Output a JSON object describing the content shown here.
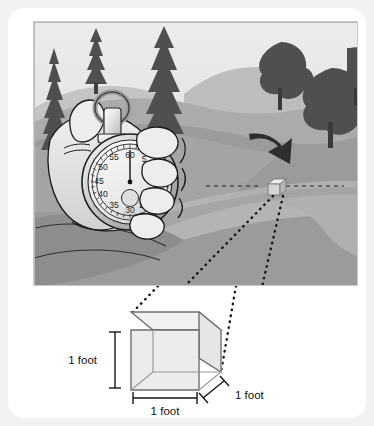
{
  "figure": {
    "type": "illustration",
    "background_color": "#f2f2f2",
    "card_color": "#ffffff"
  },
  "scene": {
    "name": "landscape-photo",
    "sky_color": "#e3e3e3",
    "hill_far_color": "#bdbdbd",
    "hill_mid_color": "#a8a8a8",
    "hill_near_color": "#9a9a9a",
    "field_color": "#8f8f8f",
    "road_color": "#b0b0b0",
    "road_shadow_color": "#9d9d9d",
    "tree_color": "#4f4f4f",
    "trunk_color": "#3f3f3f",
    "arrow_color": "#2b2b2b",
    "conifers": [
      {
        "name": "conifer-left-edge",
        "x": 34,
        "y": 14,
        "w": 20,
        "h": 118
      },
      {
        "name": "conifer-left-inner",
        "x": 82,
        "y": 7,
        "w": 22,
        "h": 56
      },
      {
        "name": "conifer-center-tall",
        "x": 128,
        "y": 6,
        "w": 42,
        "h": 110
      }
    ],
    "deciduous_trees": [
      {
        "name": "tree-right-upper",
        "cx": 247,
        "cy": 49,
        "r": 26
      },
      {
        "name": "tree-right-lower",
        "cx": 298,
        "cy": 80,
        "r": 33
      },
      {
        "name": "tree-far-right",
        "cx": 331,
        "cy": 45,
        "r": 20
      }
    ],
    "arrow": {
      "name": "direction-arrow",
      "points": "240,140 266,136 259,148 272,158 262,168 252,158 243,163"
    },
    "road_cube": {
      "name": "road-reference-cube",
      "x": 238,
      "y": 158,
      "size": 11,
      "face_color": "#d2d2d2",
      "top_color": "#e6e6e6",
      "side_color": "#b4b4b4"
    },
    "guide_line": {
      "name": "horizontal-dashed-guide",
      "color": "#2b2b2b",
      "y": 164,
      "x1": 196,
      "x2": 300
    }
  },
  "stopwatch": {
    "name": "stopwatch",
    "body_color": "#e9e9e9",
    "dial_color": "#f2f2f2",
    "rim_color": "#c4c4c4",
    "needle_color": "#1a1a1a",
    "outline_color": "#111111",
    "hand_color": "#e4e4e4",
    "center_x": 96,
    "center_y": 160,
    "dial_radius": 42,
    "needle_value": 60,
    "dial_numbers": [
      {
        "value": "60",
        "angle": 0
      },
      {
        "value": "5",
        "angle": 30
      },
      {
        "value": "25",
        "angle": 150
      },
      {
        "value": "30",
        "angle": 180
      },
      {
        "value": "35",
        "angle": 210
      },
      {
        "value": "40",
        "angle": 240
      },
      {
        "value": "45",
        "angle": 270
      },
      {
        "value": "50",
        "angle": 300
      },
      {
        "value": "55",
        "angle": 330
      }
    ]
  },
  "callout": {
    "name": "zoom-callout",
    "dotted_color": "#1a1a1a",
    "left_line": {
      "x1": 260,
      "y1": 176,
      "x2": 150,
      "y2": 292
    },
    "right_line": {
      "x1": 268,
      "y1": 176,
      "x2": 212,
      "y2": 364
    }
  },
  "cube_diagram": {
    "name": "cubic-foot-diagram",
    "edge_color": "#6a6a6a",
    "face_color": "#e8e8e8",
    "top_face_color": "#f4f4f4",
    "tick_color": "#1a1a1a",
    "labels": {
      "height": "1 foot",
      "width": "1 foot",
      "depth": "1 foot"
    }
  }
}
